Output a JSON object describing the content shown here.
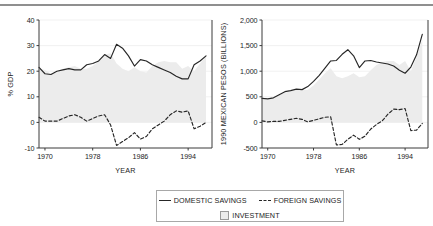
{
  "legend": {
    "entries": [
      {
        "label": "DOMESTIC SAVINGS",
        "marker": "solid-line",
        "color": "#262626"
      },
      {
        "label": "FOREIGN SAVINGS",
        "marker": "dashed-line",
        "color": "#262626"
      },
      {
        "label": "INVESTMENT",
        "marker": "filled-square",
        "color": "#ececec"
      }
    ]
  },
  "chart_data": [
    {
      "id": "percent-gdp",
      "type": "line",
      "title": "",
      "xlabel": "YEAR",
      "ylabel": "% GDP",
      "xlim": [
        1969,
        1998
      ],
      "ylim": [
        -10,
        40
      ],
      "xticks": [
        1970,
        1978,
        1986,
        1994
      ],
      "yticks": [
        -10,
        0,
        10,
        20,
        30,
        40
      ],
      "ytick_labels": [
        "-10",
        "0",
        "10",
        "20",
        "30",
        "40"
      ],
      "grid": true,
      "legend_position": "below",
      "x": [
        1969,
        1970,
        1971,
        1972,
        1973,
        1974,
        1975,
        1976,
        1977,
        1978,
        1979,
        1980,
        1981,
        1982,
        1983,
        1984,
        1985,
        1986,
        1987,
        1988,
        1989,
        1990,
        1991,
        1992,
        1993,
        1994,
        1995,
        1996,
        1997
      ],
      "series": [
        {
          "name": "INVESTMENT",
          "type": "area",
          "fill": "#ececec",
          "values": [
            21.0,
            20.5,
            19.0,
            19.5,
            21.0,
            21.5,
            22.0,
            21.0,
            21.0,
            22.0,
            24.0,
            26.5,
            27.0,
            23.0,
            21.0,
            20.0,
            21.5,
            20.0,
            19.5,
            22.0,
            23.5,
            24.0,
            23.5,
            23.5,
            21.0,
            22.0,
            20.0,
            23.0,
            26.0
          ]
        },
        {
          "name": "DOMESTIC SAVINGS",
          "type": "line",
          "style": "solid",
          "color": "#262626",
          "values": [
            21.5,
            19.0,
            18.7,
            20.0,
            20.5,
            21.0,
            20.5,
            20.5,
            22.5,
            23.0,
            24.0,
            26.5,
            25.0,
            30.5,
            29.0,
            26.0,
            22.0,
            24.5,
            24.0,
            22.5,
            21.5,
            20.5,
            19.5,
            18.0,
            17.0,
            17.0,
            22.5,
            24.0,
            26.0
          ]
        },
        {
          "name": "FOREIGN SAVINGS",
          "type": "line",
          "style": "dashed",
          "color": "#262626",
          "values": [
            2.0,
            0.5,
            0.5,
            0.5,
            1.5,
            2.5,
            3.0,
            2.0,
            0.5,
            1.5,
            2.5,
            3.0,
            -1.0,
            -9.0,
            -7.5,
            -6.0,
            -4.0,
            -6.5,
            -5.5,
            -2.5,
            -1.0,
            0.5,
            3.0,
            4.5,
            4.0,
            4.5,
            -2.5,
            -1.5,
            0.0
          ]
        }
      ]
    },
    {
      "id": "pesos-billions",
      "type": "line",
      "title": "",
      "xlabel": "YEAR",
      "ylabel": "1990 MEXICAN PESOS (BILLIONS)",
      "xlim": [
        1969,
        1998
      ],
      "ylim": [
        -500,
        2000
      ],
      "xticks": [
        1970,
        1978,
        1986,
        1994
      ],
      "yticks": [
        -500,
        0,
        500,
        1000,
        1500,
        2000
      ],
      "ytick_labels": [
        "-500",
        "0",
        "500",
        "1,000",
        "1,500",
        "2,000"
      ],
      "grid": true,
      "legend_position": "below",
      "x": [
        1969,
        1970,
        1971,
        1972,
        1973,
        1974,
        1975,
        1976,
        1977,
        1978,
        1979,
        1980,
        1981,
        1982,
        1983,
        1984,
        1985,
        1986,
        1987,
        1988,
        1989,
        1990,
        1991,
        1992,
        1993,
        1994,
        1995,
        1996,
        1997
      ],
      "series": [
        {
          "name": "INVESTMENT",
          "type": "area",
          "fill": "#ececec",
          "values": [
            450,
            440,
            470,
            530,
            580,
            610,
            640,
            630,
            640,
            720,
            840,
            960,
            1060,
            900,
            860,
            900,
            960,
            880,
            900,
            1020,
            1120,
            1180,
            1200,
            1200,
            1120,
            1200,
            1000,
            1280,
            1620
          ]
        },
        {
          "name": "DOMESTIC SAVINGS",
          "type": "line",
          "style": "solid",
          "color": "#262626",
          "values": [
            470,
            460,
            480,
            540,
            600,
            620,
            650,
            640,
            700,
            800,
            920,
            1060,
            1200,
            1210,
            1330,
            1420,
            1300,
            1070,
            1200,
            1210,
            1180,
            1160,
            1140,
            1100,
            1020,
            960,
            1080,
            1320,
            1720
          ]
        },
        {
          "name": "FOREIGN SAVINGS",
          "type": "line",
          "style": "dashed",
          "color": "#262626",
          "values": [
            30,
            10,
            20,
            20,
            40,
            60,
            80,
            60,
            10,
            40,
            70,
            100,
            110,
            -440,
            -430,
            -330,
            -250,
            -330,
            -270,
            -130,
            -40,
            30,
            160,
            260,
            250,
            270,
            -160,
            -150,
            -20
          ]
        }
      ]
    }
  ]
}
